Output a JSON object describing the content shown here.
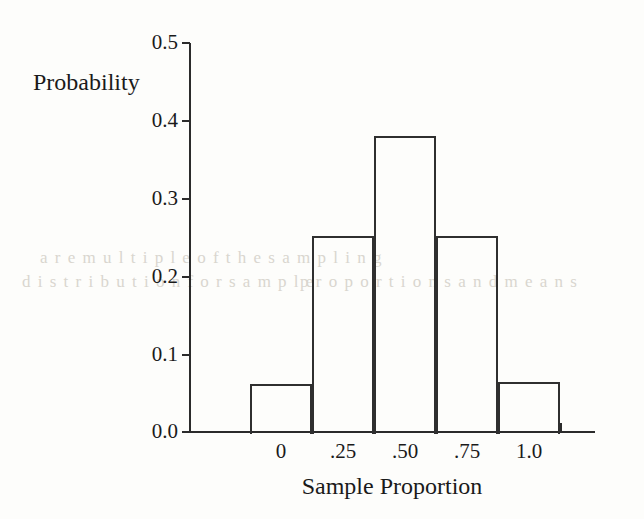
{
  "figure": {
    "background_color": "#fdfdfb",
    "ink_color": "#2b2b2b",
    "probability_label": "Probability",
    "xaxis_title": "Sample Proportion"
  },
  "chart_data": {
    "type": "bar",
    "title": "",
    "subtitle": "",
    "xlabel": "Sample Proportion",
    "ylabel": "Probability",
    "categories": [
      "0",
      ".25",
      ".50",
      ".75",
      "1.0"
    ],
    "values": [
      0.0625,
      0.25,
      0.375,
      0.25,
      0.0625
    ],
    "bin_edges": [
      -0.125,
      0.125,
      0.375,
      0.625,
      0.875,
      1.125
    ],
    "xlim": [
      -0.25,
      1.25
    ],
    "ylim": [
      0.0,
      0.5
    ],
    "ytick_labels": [
      "0.0",
      "0.1",
      "0.2",
      "0.3",
      "0.4",
      "0.5"
    ],
    "ytick_values": [
      0.0,
      0.1,
      0.2,
      0.3,
      0.4,
      0.5
    ],
    "xtick_labels": [
      "0",
      ".25",
      ".50",
      ".75",
      "1.0"
    ],
    "xtick_values": [
      0,
      0.25,
      0.5,
      0.75,
      1.0
    ],
    "grid": false,
    "legend": false,
    "legend_position": "none",
    "bar_fill": "none",
    "bar_edge_color": "#2f2f2f",
    "annotations": []
  },
  "axes": {
    "y_ticks": [
      {
        "label": "0.5",
        "y": 43
      },
      {
        "label": "0.4",
        "y": 121
      },
      {
        "label": "0.3",
        "y": 199
      },
      {
        "label": "0.2",
        "y": 277
      },
      {
        "label": "0.1",
        "y": 355
      },
      {
        "label": "0.0",
        "y": 432
      }
    ],
    "x_ticks": [
      189,
      250,
      312,
      374,
      436,
      498,
      560
    ],
    "x_tick_labels": [
      {
        "label": "0",
        "left": 250
      },
      {
        "label": ".25",
        "left": 312
      },
      {
        "label": ".50",
        "left": 374
      },
      {
        "label": ".75",
        "left": 436
      },
      {
        "label": "1.0",
        "left": 498
      }
    ]
  },
  "bars": [
    {
      "name": "bar-0",
      "category": "0",
      "value": 0.0625,
      "left": 250,
      "top": 384,
      "width": 62,
      "height": 48
    },
    {
      "name": "bar-25",
      "category": ".25",
      "value": 0.25,
      "left": 312,
      "top": 236,
      "width": 62,
      "height": 196
    },
    {
      "name": "bar-50",
      "category": ".50",
      "value": 0.375,
      "left": 374,
      "top": 136,
      "width": 62,
      "height": 296
    },
    {
      "name": "bar-75",
      "category": ".75",
      "value": 0.25,
      "left": 436,
      "top": 236,
      "width": 62,
      "height": 196
    },
    {
      "name": "bar-100",
      "category": "1.0",
      "value": 0.0625,
      "left": 498,
      "top": 382,
      "width": 62,
      "height": 50
    }
  ],
  "bleed_artifacts": [
    {
      "text": "a r e  m u l t i p l e   o f   t h e   s a m p l i n g",
      "left": 40,
      "top": 248
    },
    {
      "text": "d i s t r i b u t i o n   f o r   s a m p l e",
      "left": 22,
      "top": 272
    },
    {
      "text": "p r o p o r t i o n s   a n d   m e a n s",
      "left": 300,
      "top": 272
    }
  ]
}
